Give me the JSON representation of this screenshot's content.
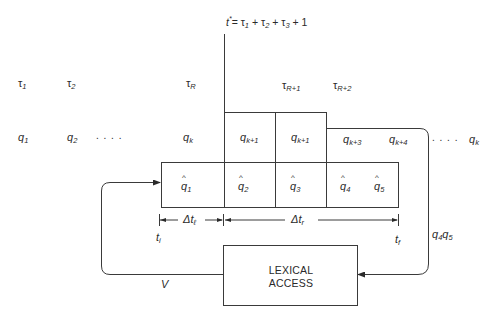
{
  "equation": {
    "lhs": "t*",
    "rhs": "= τ1 + τ2 + τ3 + 1",
    "tokens": [
      "t",
      "*",
      "= τ",
      "1",
      " + τ",
      "2",
      " + τ",
      "3",
      " + 1"
    ]
  },
  "tau_row": [
    {
      "base": "τ",
      "sub": "1"
    },
    {
      "base": "τ",
      "sub": "2"
    },
    {
      "base": "τ",
      "sub": "R"
    },
    {
      "base": "τ",
      "sub": "R+1"
    },
    {
      "base": "τ",
      "sub": "R+2"
    }
  ],
  "q_row": [
    {
      "base": "q",
      "sub": "1"
    },
    {
      "base": "q",
      "sub": "2"
    },
    {
      "ellipsis": ". . . ."
    },
    {
      "base": "q",
      "sub": "k"
    },
    {
      "base": "q",
      "sub": "k+1"
    },
    {
      "base": "q",
      "sub": "k+1"
    },
    {
      "base": "q",
      "sub": "k+3"
    },
    {
      "base": "q",
      "sub": "k+4"
    },
    {
      "ellipsis": ". . . ."
    },
    {
      "base": "q",
      "sub": "k"
    }
  ],
  "qhat_row": [
    {
      "hat": "^",
      "base": "q",
      "sub": "1"
    },
    {
      "hat": "^",
      "base": "q",
      "sub": "2"
    },
    {
      "hat": "^",
      "base": "q",
      "sub": "3"
    },
    {
      "hat": "^",
      "base": "q",
      "sub": "4"
    },
    {
      "hat": "^",
      "base": "q",
      "sub": "5"
    }
  ],
  "intervals": {
    "delta_left": {
      "base": "Δt",
      "sub": "ℓ"
    },
    "delta_right": {
      "base": "Δt",
      "sub": "r"
    },
    "t_initial": {
      "base": "t",
      "sub": "i"
    },
    "t_final": {
      "base": "t",
      "sub": "f"
    }
  },
  "lexical_box": {
    "line1": "LEXICAL",
    "line2": "ACCESS"
  },
  "feedback_label": "V",
  "output_label": {
    "q4": "q",
    "q4_sub": "4",
    "q5": "q",
    "q5_sub": "5"
  },
  "colors": {
    "line": "#3a3a3a",
    "text": "#2a2a2a",
    "background": "#ffffff"
  }
}
